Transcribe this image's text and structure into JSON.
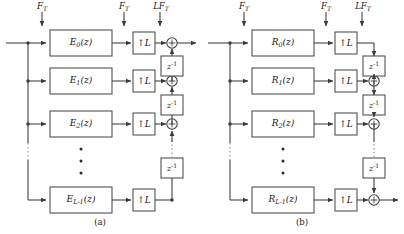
{
  "figure": {
    "type": "block-diagram",
    "panels": [
      {
        "id": "a",
        "caption": "(a)",
        "branch_prefix": "E",
        "rate_labels": [
          {
            "text": "F_T",
            "base": "F",
            "sub": "T",
            "prefix": ""
          },
          {
            "text": "F_T",
            "base": "F",
            "sub": "T",
            "prefix": ""
          },
          {
            "text": "LF_T",
            "base": "F",
            "sub": "T",
            "prefix": "L"
          }
        ],
        "branches": [
          {
            "filter_base": "E",
            "filter_sub": "0",
            "filter_arg": "(z)",
            "up_label": "L"
          },
          {
            "filter_base": "E",
            "filter_sub": "1",
            "filter_arg": "(z)",
            "up_label": "L"
          },
          {
            "filter_base": "E",
            "filter_sub": "2",
            "filter_arg": "(z)",
            "up_label": "L"
          },
          {
            "filter_base": "E",
            "filter_sub": "L-1",
            "filter_arg": "(z)",
            "up_label": "L"
          }
        ],
        "delay_label_base": "z",
        "delay_label_exp": "-1",
        "delay_count": 3,
        "adder_sign": "+",
        "adder_count": 3,
        "ellipsis_dots": 3,
        "output_side": "top-right"
      },
      {
        "id": "b",
        "caption": "(b)",
        "branch_prefix": "R",
        "rate_labels": [
          {
            "text": "F_T",
            "base": "F",
            "sub": "T",
            "prefix": ""
          },
          {
            "text": "F_T",
            "base": "F",
            "sub": "T",
            "prefix": ""
          },
          {
            "text": "LF_T",
            "base": "F",
            "sub": "T",
            "prefix": "L"
          }
        ],
        "branches": [
          {
            "filter_base": "R",
            "filter_sub": "0",
            "filter_arg": "(z)",
            "up_label": "L"
          },
          {
            "filter_base": "R",
            "filter_sub": "1",
            "filter_arg": "(z)",
            "up_label": "L"
          },
          {
            "filter_base": "R",
            "filter_sub": "2",
            "filter_arg": "(z)",
            "up_label": "L"
          },
          {
            "filter_base": "R",
            "filter_sub": "L-1",
            "filter_arg": "(z)",
            "up_label": "L"
          }
        ],
        "delay_label_base": "z",
        "delay_label_exp": "-1",
        "delay_count": 3,
        "adder_sign": "+",
        "adder_count": 3,
        "ellipsis_dots": 3,
        "output_side": "bottom-right"
      }
    ],
    "up_arrow_glyph": "↑",
    "colors": {
      "line": "#3a3a3a",
      "box_border": "#4a4a4a",
      "box_fill": "#ffffff",
      "text": "#1a1a1a",
      "dotted": "#9a9a9a"
    }
  }
}
